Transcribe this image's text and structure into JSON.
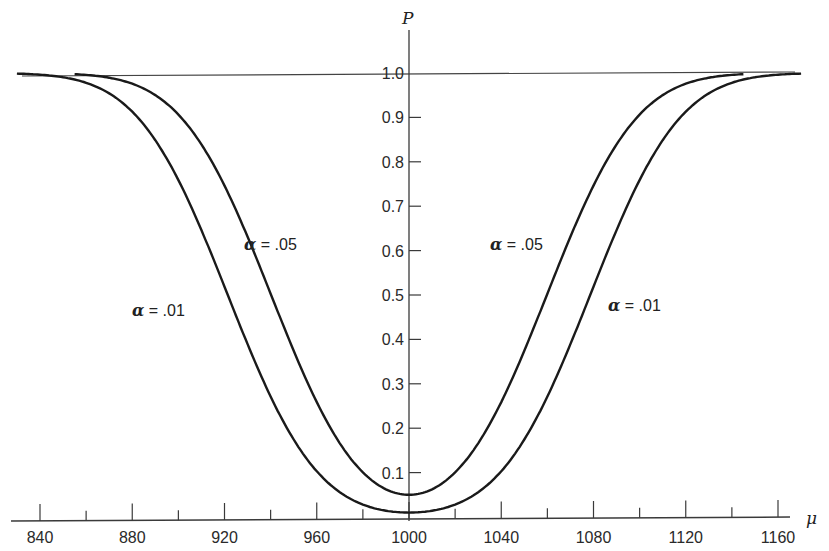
{
  "chart_data": {
    "type": "line",
    "title": "",
    "xlabel": "μ",
    "ylabel": "P",
    "xlim": [
      828,
      1168
    ],
    "ylim": [
      0,
      1.08
    ],
    "x_ticks": [
      840,
      880,
      920,
      960,
      1000,
      1040,
      1080,
      1120,
      1160
    ],
    "x_minor_ticks": [
      860,
      900,
      940,
      980,
      1020,
      1060,
      1100,
      1140
    ],
    "x_tick_labels": [
      "840",
      "880",
      "920",
      "960",
      "1000",
      "1040",
      "1080",
      "1120",
      "1160"
    ],
    "y_ticks": [
      0.1,
      0.2,
      0.3,
      0.4,
      0.5,
      0.6,
      0.7,
      0.8,
      0.9,
      1.0
    ],
    "y_tick_labels": [
      "0.1",
      "0.2",
      "0.3",
      "0.4",
      "0.5",
      "0.6",
      "0.7",
      "0.8",
      "0.9",
      "1.0"
    ],
    "reference_line": {
      "y": 1.0,
      "label": "1.0"
    },
    "grid": false,
    "legend": "none (inline labels)",
    "series": [
      {
        "name": "α = .05",
        "label_alpha": "α",
        "label_value": "= .05",
        "x": [
          855,
          880,
          900,
          920,
          940,
          960,
          980,
          1000,
          1020,
          1040,
          1060,
          1080,
          1100,
          1120,
          1145
        ],
        "values": [
          0.99,
          0.96,
          0.89,
          0.75,
          0.52,
          0.29,
          0.11,
          0.05,
          0.11,
          0.29,
          0.52,
          0.75,
          0.89,
          0.96,
          0.99
        ],
        "min": {
          "x": 1000,
          "y": 0.05
        }
      },
      {
        "name": "α = .01",
        "label_alpha": "α",
        "label_value": "= .01",
        "x": [
          830,
          860,
          880,
          900,
          920,
          940,
          960,
          980,
          1000,
          1020,
          1040,
          1060,
          1080,
          1100,
          1120,
          1140,
          1170
        ],
        "values": [
          0.98,
          0.93,
          0.85,
          0.7,
          0.47,
          0.26,
          0.11,
          0.03,
          0.01,
          0.03,
          0.11,
          0.26,
          0.47,
          0.7,
          0.85,
          0.93,
          0.99
        ],
        "min": {
          "x": 1000,
          "y": 0.01
        }
      }
    ]
  },
  "labels": {
    "y_axis_title": "P",
    "x_axis_title": "μ",
    "left_05_alpha": "α",
    "left_05_value": " = .05",
    "left_01_alpha": "α",
    "left_01_value": " = .01",
    "right_05_alpha": "α",
    "right_05_value": " = .05",
    "right_01_alpha": "α",
    "right_01_value": " = .01"
  },
  "style": {
    "line_color": "#1a1a1a",
    "axis_color": "#3a3a3a"
  }
}
